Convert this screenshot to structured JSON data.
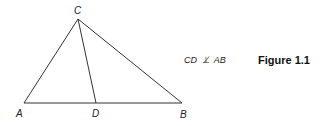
{
  "diagram": {
    "type": "triangle",
    "points": {
      "A": {
        "label": "A",
        "x": 24,
        "y": 103
      },
      "B": {
        "label": "B",
        "x": 182,
        "y": 103
      },
      "C": {
        "label": "C",
        "x": 78,
        "y": 19
      },
      "D": {
        "label": "D",
        "x": 96,
        "y": 103
      }
    },
    "segments": [
      "AB",
      "AC",
      "BC",
      "CD"
    ],
    "relation": {
      "left": "CD",
      "symbol": "⊥̸",
      "right": "AB"
    },
    "caption": "Figure 1.1",
    "stroke_color": "#333333"
  }
}
